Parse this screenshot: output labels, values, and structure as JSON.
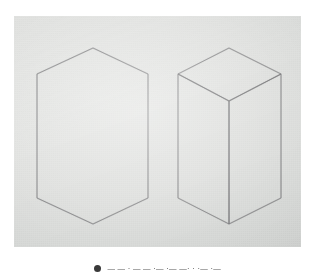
{
  "figure": {
    "name": "pencil-drawing-photograph",
    "paper_color": "#e3e4e2",
    "line_color": "#6e6e70",
    "shapes": [
      {
        "name": "hexagon-outline",
        "type": "regular-hexagon",
        "orientation": "point-up",
        "vertex_count": 6,
        "vertices": [
          [
            79,
            32
          ],
          [
            134,
            58
          ],
          [
            134,
            182
          ],
          [
            79,
            208
          ],
          [
            23,
            182
          ],
          [
            23,
            58
          ]
        ]
      },
      {
        "name": "isometric-box",
        "type": "rectangular-prism",
        "visible_faces": 3,
        "face_labels": [
          "top",
          "left",
          "right"
        ],
        "vertices": {
          "top_back": [
            215,
            32
          ],
          "top_left": [
            164,
            58
          ],
          "top_front": [
            215,
            85
          ],
          "top_right": [
            267,
            58
          ],
          "bottom_left": [
            164,
            182
          ],
          "bottom_front": [
            215,
            208
          ],
          "bottom_right": [
            267,
            182
          ]
        },
        "edges": [
          "top_back-top_left",
          "top_left-top_front",
          "top_front-top_right",
          "top_right-top_back",
          "top_left-bottom_left",
          "top_front-bottom_front",
          "top_right-bottom_right",
          "bottom_left-bottom_front",
          "bottom_front-bottom_right"
        ]
      }
    ]
  },
  "caption": {
    "marker_icon": "bullet-marker-icon",
    "text": "— — ·  — —      ·— ·—  —·  · ·— ·—"
  }
}
